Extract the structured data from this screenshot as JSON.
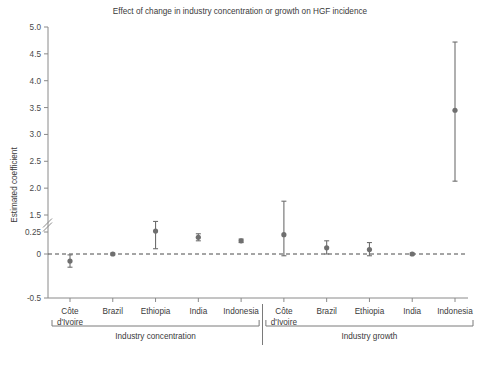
{
  "chart_data": {
    "type": "scatter",
    "title": "Effect of change in industry concentration or growth on HGF incidence",
    "xlabel": "",
    "ylabel": "Estimated coefficient",
    "ylim": [
      -0.5,
      5.0
    ],
    "grid": false,
    "legend": "none",
    "axis_break": {
      "between": [
        0.25,
        1.5
      ],
      "style": "double-slash"
    },
    "y_ticks": [
      "5.0",
      "4.5",
      "4.0",
      "3.5",
      "3.0",
      "2.5",
      "2.0",
      "1.5",
      "0.25",
      "0",
      "-0.5"
    ],
    "y_tick_values": [
      5.0,
      4.5,
      4.0,
      3.5,
      3.0,
      2.5,
      2.0,
      1.5,
      0.25,
      0,
      -0.5
    ],
    "reference_line": {
      "value": 0,
      "style": "dashed"
    },
    "groups": [
      {
        "name": "Industry concentration",
        "categories": [
          "Côte d'Ivoire",
          "Brazil",
          "Ethiopia",
          "India",
          "Indonesia"
        ],
        "values": [
          -0.08,
          0.0,
          0.26,
          0.19,
          0.15
        ],
        "ci_low": [
          -0.15,
          -0.01,
          0.06,
          0.15,
          0.13
        ],
        "ci_high": [
          -0.01,
          0.01,
          0.37,
          0.23,
          0.17
        ]
      },
      {
        "name": "Industry growth",
        "categories": [
          "Côte d'Ivoire",
          "Brazil",
          "Ethiopia",
          "India",
          "Indonesia"
        ],
        "values": [
          0.22,
          0.07,
          0.05,
          0.0,
          3.45
        ],
        "ci_low": [
          -0.02,
          0.0,
          -0.02,
          -0.01,
          2.13
        ],
        "ci_high": [
          0.6,
          0.15,
          0.13,
          0.01,
          4.72
        ]
      }
    ],
    "colors": {
      "marker": "#6f6f6f",
      "error_bar": "#6f6f6f",
      "axis": "#8a8a8a",
      "text": "#3a3a3a",
      "zero_line": "#4a4a4a"
    }
  }
}
